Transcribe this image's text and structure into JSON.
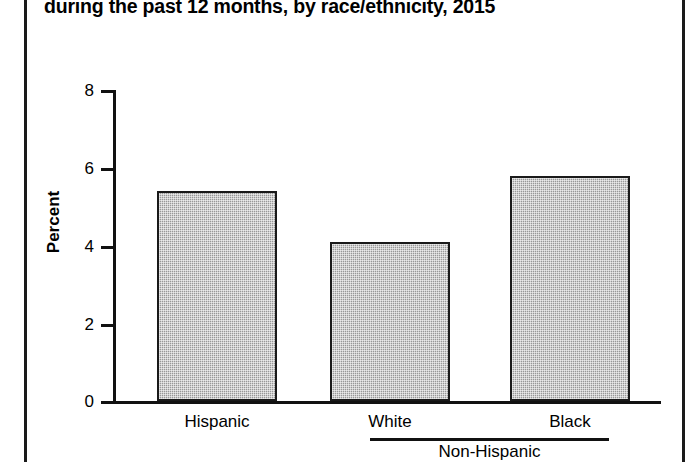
{
  "title": "during the past 12 months, by race/ethnicity, 2015",
  "chart_data": {
    "type": "bar",
    "title": "during the past 12 months, by race/ethnicity, 2015",
    "categories": [
      "Hispanic",
      "White",
      "Black"
    ],
    "values": [
      5.4,
      4.1,
      5.8
    ],
    "group_labels": [
      {
        "label": "Non-Hispanic",
        "covers": [
          "White",
          "Black"
        ]
      }
    ],
    "xlabel": "",
    "ylabel": "Percent",
    "ylim": [
      0,
      8
    ],
    "yticks": [
      0,
      2,
      4,
      6,
      8
    ],
    "ytick_labels": [
      "0",
      "2",
      "4",
      "6",
      "8"
    ],
    "grid": false,
    "legend": null,
    "bar_fill_color": "#a9a9a9",
    "bar_edge_color": "#1a1a1a"
  },
  "axis": {
    "y_title": "Percent",
    "ticks": [
      {
        "label": "8",
        "value": 8
      },
      {
        "label": "6",
        "value": 6
      },
      {
        "label": "4",
        "value": 4
      },
      {
        "label": "2",
        "value": 2
      },
      {
        "label": "0",
        "value": 0
      }
    ]
  },
  "x_categories": [
    {
      "label": "Hispanic"
    },
    {
      "label": "White"
    },
    {
      "label": "Black"
    }
  ],
  "group": {
    "label": "Non-Hispanic"
  },
  "colors": {
    "bar_fill": "#a9a9a9",
    "bar_edge": "#1a1a1a",
    "axis": "#111111",
    "text": "#000000",
    "frame_rule": "#1a1a1a"
  }
}
